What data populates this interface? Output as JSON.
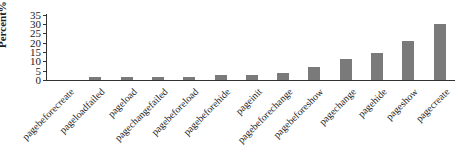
{
  "chart_data": {
    "type": "bar",
    "title": "",
    "xlabel": "",
    "ylabel": "Percent%",
    "ylim": [
      0,
      35
    ],
    "yticks": [
      0,
      5,
      10,
      15,
      20,
      25,
      30,
      35
    ],
    "grid": false,
    "legend": null,
    "bar_color": "#7a7a7a",
    "categories": [
      "pagebeforecreate",
      "pageloadfailed",
      "pageload",
      "pagechangefailed",
      "pagebeforeload",
      "pagebeforehide",
      "pageinit",
      "pagebeforechange",
      "pagebeforeshow",
      "pagechange",
      "pagehide",
      "pageshow",
      "pagecreate"
    ],
    "values": [
      0,
      1.5,
      1.5,
      1.5,
      1.5,
      2.8,
      2.8,
      4,
      7,
      11,
      14.5,
      21,
      30
    ]
  },
  "axis": {
    "ylabel": "Percent%",
    "ytick_labels": [
      "0",
      "5",
      "10",
      "15",
      "20",
      "25",
      "30",
      "35"
    ]
  }
}
